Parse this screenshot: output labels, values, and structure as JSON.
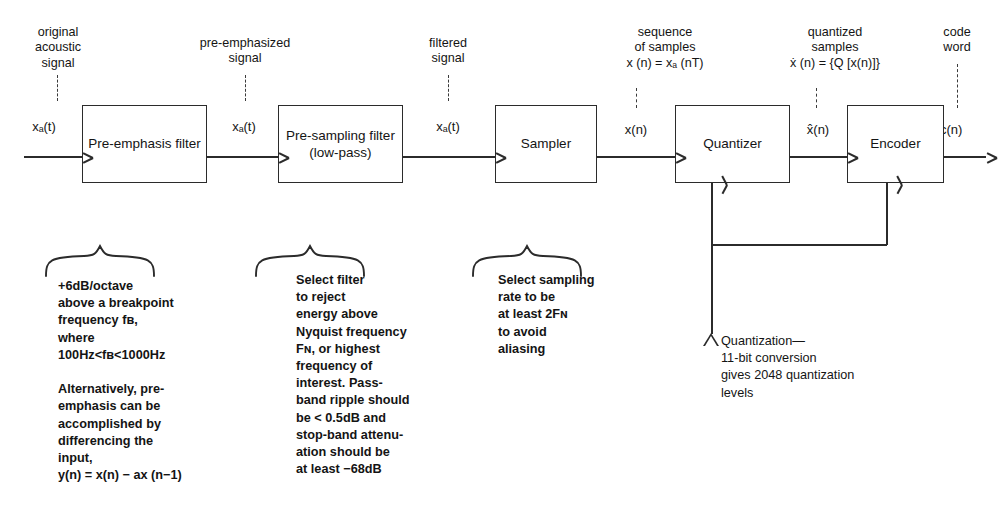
{
  "figure": {
    "ink_color": "#2b2b2b",
    "background": "#ffffff"
  },
  "input": {
    "caption": "original\nacoustic\nsignal",
    "signal": "xₐ(t)"
  },
  "output": {
    "caption": "code\nword",
    "signal": "c(n)"
  },
  "blocks": [
    {
      "id": "pre-emphasis-filter",
      "label": "Pre-emphasis\nfilter"
    },
    {
      "id": "pre-sampling-filter",
      "label": "Pre-sampling\nfilter\n(low-pass)"
    },
    {
      "id": "sampler",
      "label": "Sampler"
    },
    {
      "id": "quantizer",
      "label": "Quantizer"
    },
    {
      "id": "encoder",
      "label": "Encoder"
    }
  ],
  "interstage": [
    {
      "id": "pre-emphasized",
      "caption": "pre-emphasized\nsignal",
      "signal": "xₐ(t)"
    },
    {
      "id": "filtered",
      "caption": "filtered\nsignal",
      "signal": "xₐ(t)"
    },
    {
      "id": "samples",
      "caption": "sequence\nof samples\nx (n) = xₐ (nT)",
      "signal": "x(n)"
    },
    {
      "id": "quantized",
      "caption": "quantized\nsamples\nẋ (n) = {Q [x(n)]}",
      "signal": "x̂(n)"
    }
  ],
  "annotations": [
    {
      "id": "pre-emphasis-note",
      "text": "+6dB/octave\nabove a breakpoint\nfrequency fʙ,\nwhere\n100Hᴢ<fʙ<1000Hᴢ\n\nAlternatively, pre-\nemphasis can be\naccomplished by\ndifferencing the\ninput,\ny(n) = x(n) − ax (n−1)"
    },
    {
      "id": "pre-sampling-note",
      "text": "Select filter\nto reject\nenergy above\nNyquist frequency\nFɴ, or highest\nfrequency of\ninterest.  Pass-\nband ripple should\nbe < 0.5dB and\nstop-band attenu-\nation should be\nat least −68dB"
    },
    {
      "id": "sampler-note",
      "text": "Select sampling\nrate to be\nat least 2Fɴ\nto avoid\naliasing"
    },
    {
      "id": "quantization-note",
      "marker": "triangle",
      "text": "Quantization—\n11-bit conversion\ngives 2048 quantization\nlevels"
    }
  ]
}
